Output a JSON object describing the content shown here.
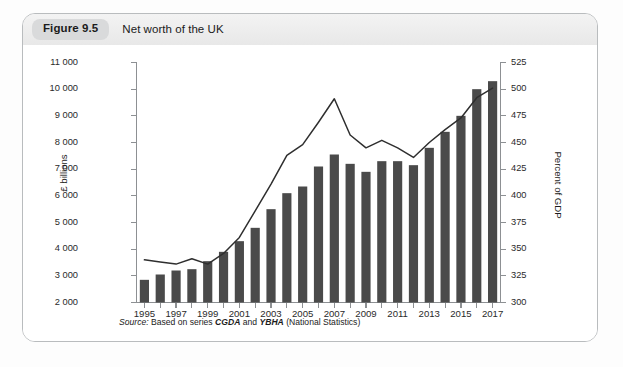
{
  "figure": {
    "badge": "Figure 9.5",
    "title": "Net worth of the UK",
    "source_prefix": "Source:",
    "source_text_1": " Based on series ",
    "source_code_1": "CGDA",
    "source_text_2": " and ",
    "source_code_2": "YBHA",
    "source_text_3": " (National Statistics)"
  },
  "colors": {
    "bar": "#4a4a4a",
    "line": "#2f2f2f",
    "axis": "#8d9093",
    "card_border": "#b9bcbe",
    "header_bg": "#eeeeee",
    "badge_bg": "#d9dadb"
  },
  "chart_data": {
    "type": "bar",
    "title": "Net worth of the UK",
    "xlabel": "",
    "ylabel": "£ billions",
    "y2label": "Percent of GDP",
    "grid": false,
    "legend": "none",
    "ylim": [
      2000,
      11000
    ],
    "ytick_step": 1000,
    "y2lim": [
      300,
      525
    ],
    "y2tick_step": 25,
    "yticks": [
      "11 000",
      "10 000",
      "9 000",
      "8 000",
      "7 000",
      "6 000",
      "5 000",
      "4 000",
      "3 000",
      "2 000"
    ],
    "y2ticks": [
      "525",
      "500",
      "475",
      "450",
      "425",
      "400",
      "375",
      "350",
      "325",
      "300"
    ],
    "categories": [
      1995,
      1996,
      1997,
      1998,
      1999,
      2000,
      2001,
      2002,
      2003,
      2004,
      2005,
      2006,
      2007,
      2008,
      2009,
      2010,
      2011,
      2012,
      2013,
      2014,
      2015,
      2016,
      2017
    ],
    "xtick_labels": [
      "1995",
      "1997",
      "1999",
      "2001",
      "2003",
      "2005",
      "2007",
      "2009",
      "2011",
      "2013",
      "2015",
      "2017"
    ],
    "series": [
      {
        "name": "Net worth",
        "unit": "£ billions",
        "axis": "left",
        "type": "bar",
        "values": [
          2850,
          3050,
          3200,
          3250,
          3550,
          3900,
          4300,
          4800,
          5500,
          6100,
          6350,
          7100,
          7550,
          7200,
          6900,
          7300,
          7300,
          7150,
          7800,
          8400,
          9000,
          10000,
          10300
        ]
      },
      {
        "name": "Net worth as percent of GDP",
        "unit": "Percent of GDP",
        "axis": "right",
        "type": "line",
        "values": [
          340,
          338,
          336,
          341,
          336,
          346,
          361,
          386,
          411,
          438,
          448,
          469,
          491,
          457,
          445,
          452,
          445,
          436,
          450,
          462,
          473,
          492,
          501
        ]
      }
    ]
  }
}
